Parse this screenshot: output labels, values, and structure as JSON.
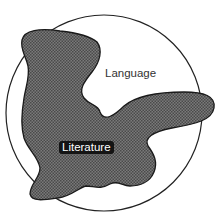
{
  "diagram": {
    "outer_region": {
      "label": "Language",
      "shape": "circle",
      "stroke_color": "#222222",
      "fill_color": "#ffffff"
    },
    "inner_region": {
      "label": "Literature",
      "shape": "irregular-blob",
      "fill_color": "#6e6e6e",
      "stroke_color": "#1a1a1a",
      "label_background": "#141414",
      "label_color": "#ffffff",
      "note": "blob extends partly outside the circle"
    }
  }
}
